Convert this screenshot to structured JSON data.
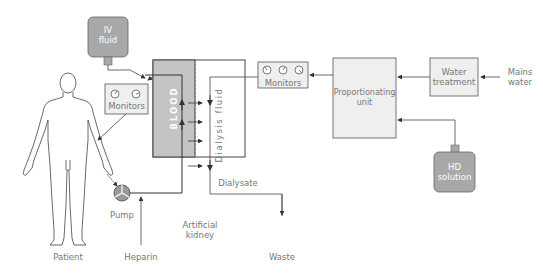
{
  "diagram": {
    "type": "hemodialysis-circuit",
    "nodes": {
      "patient": {
        "label": "Patient"
      },
      "iv_fluid": {
        "label_line1": "IV",
        "label_line2": "fluid"
      },
      "monitors_left": {
        "label": "Monitors",
        "gauges": 2
      },
      "monitors_right": {
        "label": "Monitors",
        "gauges": 3
      },
      "pump": {
        "label": "Pump"
      },
      "heparin": {
        "label": "Heparin"
      },
      "artificial_kidney": {
        "label_line1": "Artificial",
        "label_line2": "kidney"
      },
      "blood": {
        "label": "BLOOD"
      },
      "dialysis_fluid": {
        "label": "Dialysis fluid"
      },
      "dialysate": {
        "label": "Dialysate"
      },
      "waste": {
        "label": "Waste"
      },
      "proportionating_unit": {
        "label_line1": "Proportionating",
        "label_line2": "unit"
      },
      "water_treatment": {
        "label_line1": "Water",
        "label_line2": "treatment"
      },
      "mains_water": {
        "label_line1": "Mains",
        "label_line2": "water"
      },
      "hd_solution": {
        "label_line1": "HD",
        "label_line2": "solution"
      }
    },
    "edges": [
      {
        "from": "Patient",
        "to": "Pump"
      },
      {
        "from": "Heparin",
        "to": "Pump line"
      },
      {
        "from": "Pump",
        "to": "Artificial kidney (blood side)"
      },
      {
        "from": "Artificial kidney (blood side)",
        "to": "Patient",
        "via": "Monitors"
      },
      {
        "from": "IV fluid",
        "to": "Return line"
      },
      {
        "from": "Blood",
        "to": "Dialysis fluid",
        "note": "membrane transfer"
      },
      {
        "from": "Mains water",
        "to": "Water treatment"
      },
      {
        "from": "Water treatment",
        "to": "Proportionating unit"
      },
      {
        "from": "HD solution",
        "to": "Proportionating unit"
      },
      {
        "from": "Proportionating unit",
        "to": "Monitors"
      },
      {
        "from": "Monitors",
        "to": "Dialysis fluid"
      },
      {
        "from": "Dialysis fluid",
        "to": "Waste",
        "label": "Dialysate"
      }
    ],
    "colors": {
      "grey_fill": "#a8a8a8",
      "blood_fill": "#c4c4c4",
      "light_fill": "#efefef",
      "line": "#555555",
      "text": "#777777"
    }
  }
}
